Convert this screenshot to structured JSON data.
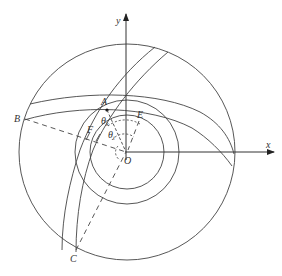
{
  "diagram": {
    "axes": {
      "x_label": "x",
      "y_label": "y",
      "origin_label": "O"
    },
    "points": {
      "A": "A",
      "B": "B",
      "C": "C",
      "E": "E",
      "F": "F"
    },
    "angles": {
      "theta_k": "θ",
      "theta_k_sub": "k",
      "theta_i": "θ",
      "theta_i_sub": "i"
    },
    "colors": {
      "line": "#444444",
      "background": "#ffffff"
    }
  }
}
